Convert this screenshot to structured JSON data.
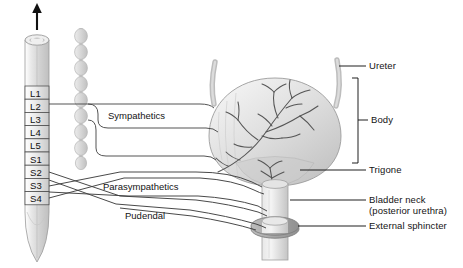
{
  "diagram": {
    "background": "#ffffff",
    "line_color": "#3a3a3a",
    "tissue_fill": "#d8d8d8",
    "text_color": "#141414"
  },
  "spinal_cord": {
    "name": "spinal-cord",
    "direction_arrow": "up-arrow",
    "segments": [
      {
        "id": "L1",
        "label": "L1"
      },
      {
        "id": "L2",
        "label": "L2"
      },
      {
        "id": "L3",
        "label": "L3"
      },
      {
        "id": "L4",
        "label": "L4"
      },
      {
        "id": "L5",
        "label": "L5"
      },
      {
        "id": "S1",
        "label": "S1"
      },
      {
        "id": "S2",
        "label": "S2"
      },
      {
        "id": "S3",
        "label": "S3"
      },
      {
        "id": "S4",
        "label": "S4"
      }
    ]
  },
  "sympathetic_chain": {
    "name": "sympathetic-chain",
    "ganglia_count": 8
  },
  "nerve_pathways": [
    {
      "id": "sympathetics",
      "label": "Sympathetics",
      "origin": "L1-L2"
    },
    {
      "id": "parasympathetics",
      "label": "Parasympathetics",
      "origin": "S2-S4"
    },
    {
      "id": "pudendal",
      "label": "Pudendal",
      "origin": "S2-S4"
    }
  ],
  "anatomy_labels": [
    {
      "id": "ureter",
      "label": "Ureter",
      "sublabel": ""
    },
    {
      "id": "body",
      "label": "Body",
      "sublabel": ""
    },
    {
      "id": "trigone",
      "label": "Trigone",
      "sublabel": ""
    },
    {
      "id": "bladder-neck",
      "label": "Bladder neck",
      "sublabel": "(posterior urethra)"
    },
    {
      "id": "external-sphincter",
      "label": "External sphincter",
      "sublabel": ""
    }
  ]
}
